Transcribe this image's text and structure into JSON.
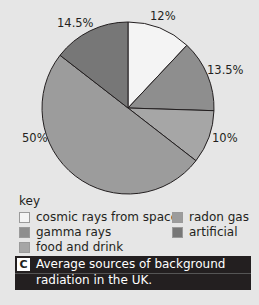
{
  "chart_data": {
    "type": "pie",
    "title": "Average sources of background radiation in the UK.",
    "slices": [
      {
        "label": "cosmic rays from space",
        "value": 12,
        "display": "12%",
        "color": "#f4f4f4"
      },
      {
        "label": "gamma rays",
        "value": 13.5,
        "display": "13.5%",
        "color": "#8e8e8e"
      },
      {
        "label": "food and drink",
        "value": 10,
        "display": "10%",
        "color": "#a6a6a6"
      },
      {
        "label": "radon gas",
        "value": 50,
        "display": "50%",
        "color": "#9c9c9c"
      },
      {
        "label": "artificial",
        "value": 14.5,
        "display": "14.5%",
        "color": "#777777"
      }
    ],
    "legend_position": "bottom"
  },
  "labels": {
    "cosmic": "12%",
    "gamma": "13.5%",
    "food": "10%",
    "radon": "50%",
    "artificial": "14.5%"
  },
  "key": {
    "title": "key",
    "items": [
      {
        "label": "cosmic rays from space",
        "color": "#f4f4f4"
      },
      {
        "label": "radon gas",
        "color": "#9c9c9c"
      },
      {
        "label": "gamma rays",
        "color": "#8e8e8e"
      },
      {
        "label": "artificial",
        "color": "#777777"
      },
      {
        "label": "food and drink",
        "color": "#a6a6a6"
      }
    ]
  },
  "caption": {
    "letter": "C",
    "text": "Average sources of background radiation in the UK."
  }
}
